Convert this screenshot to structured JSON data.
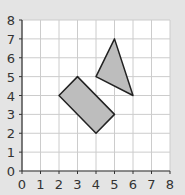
{
  "chart_data": {
    "type": "diagram",
    "title": "",
    "xlabel": "",
    "ylabel": "",
    "xlim": [
      0,
      8
    ],
    "ylim": [
      0,
      8
    ],
    "grid": true,
    "x_ticks": [
      "0",
      "1",
      "2",
      "3",
      "4",
      "5",
      "6",
      "7",
      "8"
    ],
    "y_ticks": [
      "0",
      "1",
      "2",
      "3",
      "4",
      "5",
      "6",
      "7",
      "8"
    ],
    "shapes": [
      {
        "name": "rectangle",
        "vertices": [
          [
            2,
            4
          ],
          [
            3,
            5
          ],
          [
            5,
            3
          ],
          [
            4,
            2
          ]
        ]
      },
      {
        "name": "triangle",
        "vertices": [
          [
            4,
            5
          ],
          [
            5,
            7
          ],
          [
            6,
            4
          ]
        ]
      }
    ]
  },
  "colors": {
    "background": "#e4e4e4",
    "plot_area": "#ffffff",
    "grid": "#cccccc",
    "axis": "#333333",
    "shape_fill": "#bdbdbd",
    "shape_stroke": "#222222"
  }
}
